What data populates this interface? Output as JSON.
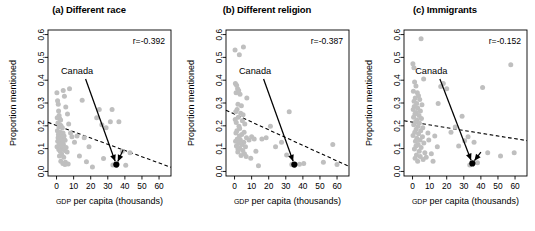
{
  "figure": {
    "width": 535,
    "height": 231,
    "background": "#ffffff",
    "point_color": "#bfbfbf",
    "highlight_color": "#000000"
  },
  "axis_common": {
    "xlabel_small_caps": "GDP",
    "xlabel_rest": " per capita (thousands)",
    "xlabel_full": "GDP per capita (thousands)",
    "ylabel": "Proportion mentioned",
    "xticks": [
      0,
      10,
      20,
      30,
      40,
      50,
      60
    ],
    "xtick_labels": [
      "0",
      "10",
      "20",
      "30",
      "40",
      "50",
      "60"
    ],
    "yticks": [
      0.0,
      0.1,
      0.2,
      0.3,
      0.4,
      0.5,
      0.6
    ],
    "ytick_labels": [
      "0.0",
      "0.1",
      "0.2",
      "0.3",
      "0.4",
      "0.5",
      "0.6"
    ],
    "xlim": [
      -5,
      67
    ],
    "ylim": [
      -0.02,
      0.62
    ],
    "grid": false,
    "annotation_label": "Canada"
  },
  "chart_data": [
    {
      "type": "scatter",
      "panel": "a",
      "title": "(a) Different race",
      "xlabel": "GDP per capita (thousands)",
      "ylabel": "Proportion mentioned",
      "xlim": [
        -5,
        67
      ],
      "ylim": [
        -0.02,
        0.62
      ],
      "grid": false,
      "correlation_label": "r=-0.392",
      "correlation": -0.392,
      "trendline": {
        "style": "dashed",
        "x": [
          -5,
          67
        ],
        "y": [
          0.215,
          0.018
        ]
      },
      "annotation": {
        "label": "Canada",
        "label_x": 12,
        "label_y": 0.425,
        "target_x": 35,
        "target_y": 0.03,
        "second_arrow_from_x": 39,
        "second_arrow_from_y": 0.095
      },
      "highlight_point": {
        "label": "Canada",
        "x": 35,
        "y": 0.03
      },
      "points": [
        [
          0.2,
          0.345
        ],
        [
          0.6,
          0.31
        ],
        [
          1.0,
          0.295
        ],
        [
          1.2,
          0.265
        ],
        [
          1.5,
          0.245
        ],
        [
          0.4,
          0.235
        ],
        [
          1.8,
          0.232
        ],
        [
          2.4,
          0.225
        ],
        [
          0.8,
          0.212
        ],
        [
          2.0,
          0.205
        ],
        [
          2.6,
          0.2
        ],
        [
          1.4,
          0.196
        ],
        [
          3.4,
          0.192
        ],
        [
          0.5,
          0.178
        ],
        [
          2.2,
          0.172
        ],
        [
          3.8,
          0.168
        ],
        [
          1.1,
          0.162
        ],
        [
          2.8,
          0.158
        ],
        [
          4.4,
          0.155
        ],
        [
          0.9,
          0.148
        ],
        [
          1.9,
          0.144
        ],
        [
          3.1,
          0.14
        ],
        [
          5.0,
          0.137
        ],
        [
          0.7,
          0.132
        ],
        [
          2.3,
          0.128
        ],
        [
          3.6,
          0.125
        ],
        [
          1.6,
          0.12
        ],
        [
          4.0,
          0.118
        ],
        [
          2.7,
          0.113
        ],
        [
          0.3,
          0.108
        ],
        [
          5.6,
          0.105
        ],
        [
          3.3,
          0.1
        ],
        [
          1.3,
          0.096
        ],
        [
          4.7,
          0.092
        ],
        [
          2.1,
          0.088
        ],
        [
          6.2,
          0.085
        ],
        [
          3.0,
          0.075
        ],
        [
          1.7,
          0.068
        ],
        [
          4.2,
          0.062
        ],
        [
          2.5,
          0.045
        ],
        [
          5.2,
          0.04
        ],
        [
          3.7,
          0.035
        ],
        [
          6.8,
          0.033
        ],
        [
          4.9,
          0.03
        ],
        [
          3.9,
          0.355
        ],
        [
          4.6,
          0.33
        ],
        [
          7.6,
          0.362
        ],
        [
          5.4,
          0.282
        ],
        [
          6.4,
          0.252
        ],
        [
          7.1,
          0.208
        ],
        [
          8.2,
          0.168
        ],
        [
          9.0,
          0.152
        ],
        [
          10.5,
          0.128
        ],
        [
          12.0,
          0.155
        ],
        [
          13.4,
          0.068
        ],
        [
          15.0,
          0.312
        ],
        [
          16.2,
          0.148
        ],
        [
          17.5,
          0.042
        ],
        [
          19.0,
          0.108
        ],
        [
          21.0,
          0.02
        ],
        [
          23.5,
          0.235
        ],
        [
          25.0,
          0.272
        ],
        [
          26.5,
          0.205
        ],
        [
          27.5,
          0.057
        ],
        [
          29.0,
          0.192
        ],
        [
          31.5,
          0.218
        ],
        [
          32.5,
          0.272
        ],
        [
          33.0,
          0.028
        ],
        [
          36.5,
          0.218
        ],
        [
          38.5,
          0.088
        ],
        [
          40.5,
          0.027
        ],
        [
          43.0,
          0.082
        ]
      ]
    },
    {
      "type": "scatter",
      "panel": "b",
      "title": "(b) Different religion",
      "xlabel": "GDP per capita (thousands)",
      "ylabel": "Proportion mentioned",
      "xlim": [
        -5,
        67
      ],
      "ylim": [
        -0.02,
        0.62
      ],
      "grid": false,
      "correlation_label": "r=-0.387",
      "correlation": -0.387,
      "trendline": {
        "style": "dashed",
        "x": [
          -5,
          67
        ],
        "y": [
          0.268,
          0.022
        ]
      },
      "annotation": {
        "label": "Canada",
        "label_x": 12,
        "label_y": 0.425,
        "target_x": 35,
        "target_y": 0.03
      },
      "highlight_point": {
        "label": "Canada",
        "x": 35,
        "y": 0.03
      },
      "points": [
        [
          0.3,
          0.532
        ],
        [
          5.2,
          0.545
        ],
        [
          2.8,
          0.512
        ],
        [
          0.5,
          0.385
        ],
        [
          1.2,
          0.378
        ],
        [
          1.8,
          0.362
        ],
        [
          2.4,
          0.355
        ],
        [
          0.9,
          0.345
        ],
        [
          3.2,
          0.338
        ],
        [
          7.2,
          0.322
        ],
        [
          2.0,
          0.295
        ],
        [
          4.0,
          0.288
        ],
        [
          1.5,
          0.272
        ],
        [
          0.7,
          0.262
        ],
        [
          3.6,
          0.255
        ],
        [
          5.0,
          0.248
        ],
        [
          2.2,
          0.238
        ],
        [
          0.4,
          0.228
        ],
        [
          4.6,
          0.222
        ],
        [
          1.0,
          0.215
        ],
        [
          6.0,
          0.208
        ],
        [
          2.6,
          0.198
        ],
        [
          3.0,
          0.188
        ],
        [
          1.4,
          0.178
        ],
        [
          5.6,
          0.172
        ],
        [
          0.8,
          0.168
        ],
        [
          4.2,
          0.162
        ],
        [
          2.9,
          0.155
        ],
        [
          7.0,
          0.148
        ],
        [
          1.6,
          0.142
        ],
        [
          3.4,
          0.138
        ],
        [
          0.6,
          0.132
        ],
        [
          5.4,
          0.128
        ],
        [
          2.4,
          0.122
        ],
        [
          4.4,
          0.118
        ],
        [
          1.1,
          0.112
        ],
        [
          6.4,
          0.108
        ],
        [
          3.1,
          0.102
        ],
        [
          2.0,
          0.098
        ],
        [
          4.8,
          0.092
        ],
        [
          1.9,
          0.085
        ],
        [
          5.8,
          0.078
        ],
        [
          3.8,
          0.07
        ],
        [
          6.8,
          0.065
        ],
        [
          8.5,
          0.138
        ],
        [
          10.0,
          0.152
        ],
        [
          11.5,
          0.142
        ],
        [
          14.0,
          0.025
        ],
        [
          16.0,
          0.142
        ],
        [
          18.5,
          0.148
        ],
        [
          21.0,
          0.198
        ],
        [
          24.0,
          0.108
        ],
        [
          27.5,
          0.128
        ],
        [
          30.5,
          0.072
        ],
        [
          32.0,
          0.262
        ],
        [
          33.5,
          0.03
        ],
        [
          38.0,
          0.032
        ],
        [
          40.5,
          0.035
        ],
        [
          52.0,
          0.04
        ],
        [
          57.5,
          0.118
        ],
        [
          60.0,
          0.03
        ],
        [
          9.5,
          0.058
        ],
        [
          12.5,
          0.088
        ]
      ]
    },
    {
      "type": "scatter",
      "panel": "c",
      "title": "(c) Immigrants",
      "xlabel": "GDP per capita (thousands)",
      "ylabel": "Proportion mentioned",
      "xlim": [
        -5,
        67
      ],
      "ylim": [
        -0.02,
        0.62
      ],
      "grid": false,
      "correlation_label": "r=-0.152",
      "correlation": -0.152,
      "trendline": {
        "style": "dashed",
        "x": [
          -5,
          67
        ],
        "y": [
          0.222,
          0.135
        ]
      },
      "annotation": {
        "label": "Canada",
        "label_x": 11,
        "label_y": 0.425,
        "target_x": 35,
        "target_y": 0.035,
        "second_arrow_from_x": 40,
        "second_arrow_from_y": 0.085
      },
      "highlight_point": {
        "label": "Canada",
        "x": 35,
        "y": 0.035
      },
      "points": [
        [
          5.0,
          0.582
        ],
        [
          0.2,
          0.472
        ],
        [
          0.8,
          0.455
        ],
        [
          57.5,
          0.468
        ],
        [
          1.2,
          0.392
        ],
        [
          2.0,
          0.375
        ],
        [
          6.5,
          0.405
        ],
        [
          0.5,
          0.352
        ],
        [
          2.8,
          0.345
        ],
        [
          3.5,
          0.332
        ],
        [
          1.6,
          0.322
        ],
        [
          4.2,
          0.315
        ],
        [
          0.9,
          0.308
        ],
        [
          2.4,
          0.298
        ],
        [
          5.5,
          0.292
        ],
        [
          1.0,
          0.285
        ],
        [
          3.0,
          0.278
        ],
        [
          0.4,
          0.272
        ],
        [
          4.6,
          0.265
        ],
        [
          2.2,
          0.258
        ],
        [
          1.4,
          0.252
        ],
        [
          3.8,
          0.245
        ],
        [
          0.6,
          0.238
        ],
        [
          5.2,
          0.232
        ],
        [
          2.6,
          0.225
        ],
        [
          1.8,
          0.218
        ],
        [
          4.0,
          0.212
        ],
        [
          0.7,
          0.205
        ],
        [
          3.2,
          0.198
        ],
        [
          6.0,
          0.192
        ],
        [
          2.1,
          0.185
        ],
        [
          4.8,
          0.178
        ],
        [
          1.3,
          0.172
        ],
        [
          3.5,
          0.165
        ],
        [
          0.3,
          0.158
        ],
        [
          5.8,
          0.152
        ],
        [
          2.5,
          0.145
        ],
        [
          4.4,
          0.138
        ],
        [
          1.7,
          0.132
        ],
        [
          6.6,
          0.125
        ],
        [
          3.3,
          0.118
        ],
        [
          2.0,
          0.112
        ],
        [
          5.0,
          0.105
        ],
        [
          1.1,
          0.098
        ],
        [
          3.9,
          0.088
        ],
        [
          7.2,
          0.082
        ],
        [
          2.3,
          0.072
        ],
        [
          4.5,
          0.065
        ],
        [
          1.5,
          0.058
        ],
        [
          6.2,
          0.052
        ],
        [
          3.0,
          0.045
        ],
        [
          8.0,
          0.062
        ],
        [
          9.5,
          0.138
        ],
        [
          11.0,
          0.078
        ],
        [
          13.0,
          0.155
        ],
        [
          14.5,
          0.108
        ],
        [
          16.5,
          0.372
        ],
        [
          15.0,
          0.298
        ],
        [
          18.0,
          0.385
        ],
        [
          20.0,
          0.362
        ],
        [
          22.5,
          0.172
        ],
        [
          25.0,
          0.195
        ],
        [
          27.0,
          0.112
        ],
        [
          29.0,
          0.242
        ],
        [
          30.5,
          0.135
        ],
        [
          32.5,
          0.152
        ],
        [
          33.5,
          0.028
        ],
        [
          36.0,
          0.128
        ],
        [
          38.0,
          0.038
        ],
        [
          41.0,
          0.368
        ],
        [
          44.0,
          0.082
        ],
        [
          51.5,
          0.068
        ],
        [
          59.5,
          0.082
        ],
        [
          9.0,
          0.168
        ],
        [
          12.0,
          0.045
        ]
      ]
    }
  ]
}
